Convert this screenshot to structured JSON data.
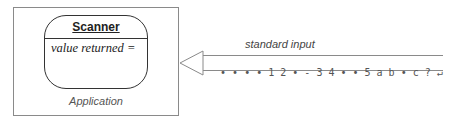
{
  "application": {
    "label": "Application"
  },
  "scanner": {
    "title": "Scanner",
    "value_label": "value returned ="
  },
  "stream": {
    "label": "standard input",
    "content": "• • • • 1 2 • - 3 4 • • 5 a b • c ? ↵",
    "tokens": [
      "•",
      "•",
      "•",
      "•",
      "1",
      "2",
      "•",
      "-",
      "3",
      "4",
      "•",
      "•",
      "5",
      "a",
      "b",
      "•",
      "c",
      "?",
      "↵"
    ],
    "arrow_icon": "arrow-left-hollow-triangle"
  },
  "colors": {
    "line": "#8a8a8a",
    "text": "#555555",
    "outline": "#333333"
  }
}
